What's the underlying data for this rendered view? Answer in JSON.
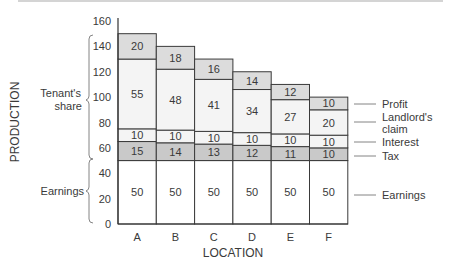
{
  "chart_data": {
    "type": "bar",
    "stacked": true,
    "title": "",
    "xlabel": "LOCATION",
    "ylabel": "PRODUCTION",
    "ylim": [
      0,
      160
    ],
    "yticks": [
      0,
      20,
      40,
      60,
      80,
      100,
      120,
      140,
      160
    ],
    "categories": [
      "A",
      "B",
      "C",
      "D",
      "E",
      "F"
    ],
    "series": [
      {
        "name": "Earnings",
        "values": [
          50,
          50,
          50,
          50,
          50,
          50
        ],
        "color": "#ffffff"
      },
      {
        "name": "Tax",
        "values": [
          15,
          14,
          13,
          12,
          11,
          10
        ],
        "color": "#c9c9c9"
      },
      {
        "name": "Interest",
        "values": [
          10,
          10,
          10,
          10,
          10,
          10
        ],
        "color": "#f4f4f4"
      },
      {
        "name": "Landlord's claim",
        "values": [
          55,
          48,
          41,
          34,
          27,
          20
        ],
        "color": "#f4f4f4"
      },
      {
        "name": "Profit",
        "values": [
          20,
          18,
          16,
          14,
          12,
          10
        ],
        "color": "#dcdcdc"
      }
    ],
    "legend": [
      "Profit",
      "Landlord's claim",
      "Interest",
      "Tax",
      "Earnings"
    ],
    "legend_position": "right",
    "annotations": [
      {
        "text": "Tenant's share",
        "range": [
          50,
          150
        ],
        "side": "left"
      },
      {
        "text": "Earnings",
        "range": [
          0,
          50
        ],
        "side": "left"
      }
    ],
    "grid": false
  },
  "labels": {
    "xlabel": "LOCATION",
    "ylabel": "PRODUCTION",
    "tenant_share_line1": "Tenant's",
    "tenant_share_line2": "share",
    "earnings_left": "Earnings",
    "legend_profit": "Profit",
    "legend_landlord_line1": "Landlord's",
    "legend_landlord_line2": "claim",
    "legend_interest": "Interest",
    "legend_tax": "Tax",
    "legend_earnings": "Earnings"
  }
}
